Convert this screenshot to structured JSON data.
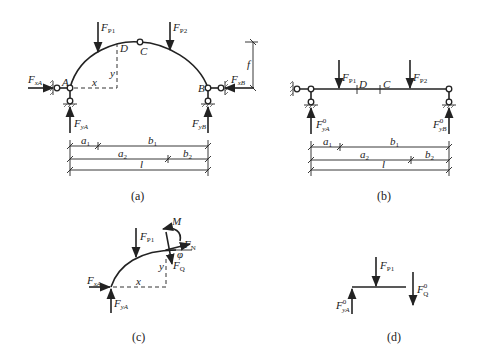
{
  "figure": {
    "panels": [
      {
        "id": "a",
        "caption": "(a)",
        "type": "three-hinged arch",
        "points": {
          "A": "A",
          "B": "B",
          "C": "C",
          "D": "D"
        },
        "loads": {
          "p1": "F",
          "p1_sub": "P1",
          "p2": "F",
          "p2_sub": "P2"
        },
        "reactions": {
          "xA": "F",
          "xA_sub": "xA",
          "yA": "F",
          "yA_sub": "yA",
          "xB": "F",
          "xB_sub": "xB",
          "yB": "F",
          "yB_sub": "yB"
        },
        "coords": {
          "x": "x",
          "y": "y",
          "rise": "f"
        },
        "dimensions": {
          "row1": [
            "a",
            "1",
            "b",
            "1"
          ],
          "row2": [
            "a",
            "2",
            "b",
            "2"
          ],
          "row3": [
            "l"
          ]
        }
      },
      {
        "id": "b",
        "caption": "(b)",
        "type": "equivalent simply supported beam",
        "points": {
          "C": "C",
          "D": "D"
        },
        "loads": {
          "p1": "F",
          "p1_sub": "P1",
          "p2": "F",
          "p2_sub": "P2"
        },
        "reactions": {
          "yA": "F",
          "yA_sup": "0",
          "yA_sub": "yA",
          "yB": "F",
          "yB_sup": "0",
          "yB_sub": "yB"
        },
        "dimensions": {
          "row1": [
            "a",
            "1",
            "b",
            "1"
          ],
          "row2": [
            "a",
            "2",
            "b",
            "2"
          ],
          "row3": [
            "l"
          ]
        }
      },
      {
        "id": "c",
        "caption": "(c)",
        "type": "arch free body",
        "labels": {
          "M": "M",
          "N": "F",
          "N_sub": "N",
          "Q": "F",
          "Q_sub": "Q",
          "phi": "φ",
          "p1": "F",
          "p1_sub": "P1",
          "xA": "F",
          "xA_sub": "xA",
          "yA": "F",
          "yA_sub": "yA",
          "x": "x",
          "y": "y"
        }
      },
      {
        "id": "d",
        "caption": "(d)",
        "type": "beam free body",
        "labels": {
          "p1": "F",
          "p1_sub": "P1",
          "Q0": "F",
          "Q0_sup": "0",
          "Q0_sub": "Q",
          "yA0": "F",
          "yA0_sup": "0",
          "yA0_sub": "yA"
        }
      }
    ]
  }
}
